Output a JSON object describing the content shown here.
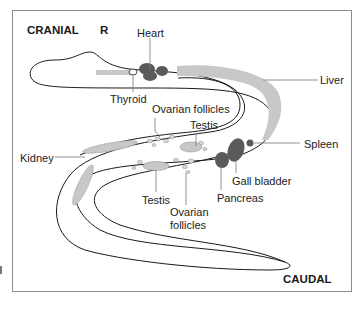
{
  "diagram": {
    "orientation": {
      "cranial": "CRANIAL",
      "side": "R",
      "caudal": "CAUDAL"
    },
    "labels": {
      "heart": "Heart",
      "thyroid": "Thyroid",
      "liver": "Liver",
      "ovarian_follicles_top": "Ovarian follicles",
      "testis_top": "Testis",
      "kidney": "Kidney",
      "spleen": "Spleen",
      "gall_bladder": "Gall bladder",
      "pancreas": "Pancreas",
      "testis_bottom": "Testis",
      "ovarian_follicles_bottom_line1": "Ovarian",
      "ovarian_follicles_bottom_line2": "follicles"
    },
    "colors": {
      "outline": "#1a1a1a",
      "dark_organ": "#5a5a5a",
      "light_organ": "#c8c8c8",
      "leader_line": "#777777",
      "frame": "#8c8c8c"
    }
  }
}
